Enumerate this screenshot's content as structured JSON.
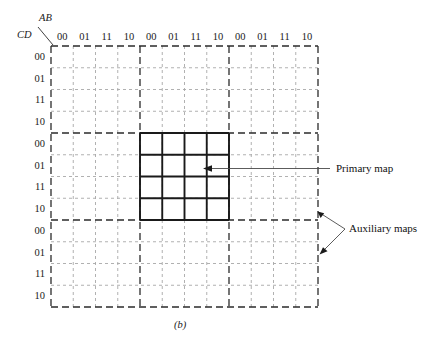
{
  "figure": {
    "caption": "(b)",
    "axis_labels": {
      "top": "AB",
      "left": "CD"
    },
    "column_labels": [
      "00",
      "01",
      "11",
      "10",
      "00",
      "01",
      "11",
      "10",
      "00",
      "01",
      "11",
      "10"
    ],
    "row_labels": [
      "00",
      "01",
      "11",
      "10",
      "00",
      "01",
      "11",
      "10",
      "00",
      "01",
      "11",
      "10"
    ],
    "annotations": {
      "primary": "Primary map",
      "auxiliary": "Auxiliary maps"
    },
    "colors": {
      "grid_light": "#a8a8a8",
      "grid_group": "#2b2b2b",
      "bold_map": "#1a1a1a",
      "text": "#1a1a1a",
      "background": "#ffffff"
    },
    "geometry": {
      "grid_left": 51,
      "grid_top": 46,
      "grid_right": 318,
      "grid_bottom": 307,
      "columns": 12,
      "rows": 12,
      "primary_map_col_start": 4,
      "primary_map_col_end": 8,
      "primary_map_row_start": 4,
      "primary_map_row_end": 8,
      "group_size": 4
    }
  }
}
